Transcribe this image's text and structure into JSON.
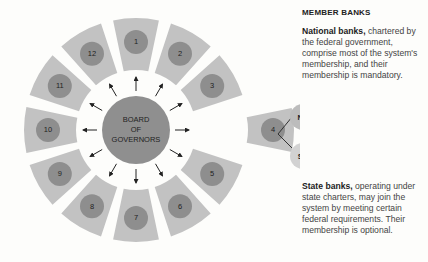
{
  "diagram": {
    "center_label": [
      "BOARD",
      "OF",
      "GOVERNORS"
    ],
    "districts": [
      "1",
      "2",
      "3",
      "4",
      "5",
      "6",
      "7",
      "8",
      "9",
      "10",
      "11",
      "12"
    ],
    "highlighted_district": "4",
    "member_bank_nodes": [
      "NB",
      "SB"
    ],
    "colors": {
      "segment_fill": "#c2c2c2",
      "district_circle": "#8e8e8e",
      "board_circle": "#8f8f8f",
      "nb_circle": "#bcbcbc",
      "sb_circle": "#d2d2d2",
      "arrow": "#222222"
    }
  },
  "sidebar": {
    "heading": "MEMBER BANKS",
    "national": {
      "lead": "National banks,",
      "text": " chartered by the federal government, comprise most of the system's membership, and their membership is mandatory."
    },
    "state": {
      "lead": "State banks,",
      "text": " operating under state charters, may join the system by meeting certain federal requirements. Their membership is optional."
    }
  }
}
